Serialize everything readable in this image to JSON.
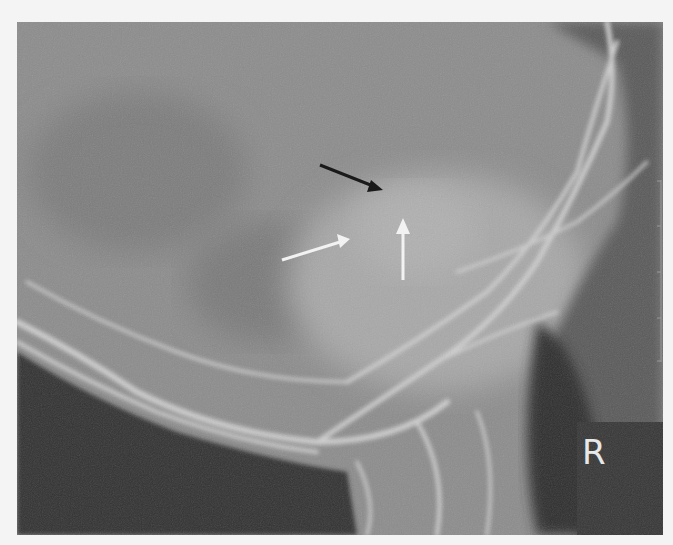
{
  "image": {
    "description": "Lateral skull radiograph showing skull base and cervical region with arrows indicating a lesion",
    "side_marker": "R",
    "arrows": [
      {
        "color": "#1a1a1a",
        "label": "black-arrow",
        "from": [
          320,
          165
        ],
        "to": [
          380,
          190
        ]
      },
      {
        "color": "#f2f2f2",
        "label": "white-arrow-diagonal",
        "from": [
          282,
          260
        ],
        "to": [
          350,
          240
        ]
      },
      {
        "color": "#f2f2f2",
        "label": "white-arrow-vertical",
        "from": [
          403,
          280
        ],
        "to": [
          403,
          218
        ]
      }
    ],
    "scale_bar": {
      "ticks": 5
    }
  }
}
